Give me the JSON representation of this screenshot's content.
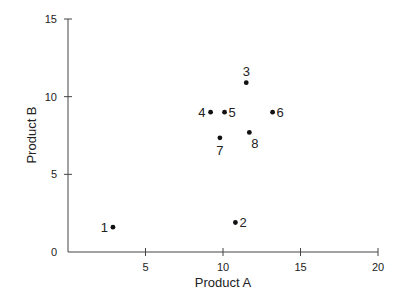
{
  "chart_data": {
    "type": "scatter",
    "title": "",
    "xlabel": "Product A",
    "ylabel": "Product B",
    "xlim": [
      0,
      20
    ],
    "ylim": [
      0,
      15
    ],
    "xticks": [
      0,
      5,
      10,
      15,
      20
    ],
    "yticks": [
      0,
      5,
      10,
      15
    ],
    "xtick_labels": [
      "",
      "5",
      "10",
      "15",
      "20"
    ],
    "ytick_labels": [
      "0",
      "5",
      "10",
      "15"
    ],
    "grid": false,
    "legend": null,
    "marker_color": "#111111",
    "axis_color": "#444444",
    "points": [
      {
        "label": "1",
        "x": 2.9,
        "y": 1.6,
        "label_pos": "left"
      },
      {
        "label": "2",
        "x": 10.8,
        "y": 1.9,
        "label_pos": "right"
      },
      {
        "label": "3",
        "x": 11.5,
        "y": 10.9,
        "label_pos": "above"
      },
      {
        "label": "4",
        "x": 9.2,
        "y": 9.0,
        "label_pos": "left"
      },
      {
        "label": "5",
        "x": 10.1,
        "y": 9.0,
        "label_pos": "right"
      },
      {
        "label": "6",
        "x": 13.2,
        "y": 9.0,
        "label_pos": "right"
      },
      {
        "label": "7",
        "x": 9.8,
        "y": 7.35,
        "label_pos": "below"
      },
      {
        "label": "8",
        "x": 11.7,
        "y": 7.7,
        "label_pos": "below-right"
      }
    ]
  }
}
